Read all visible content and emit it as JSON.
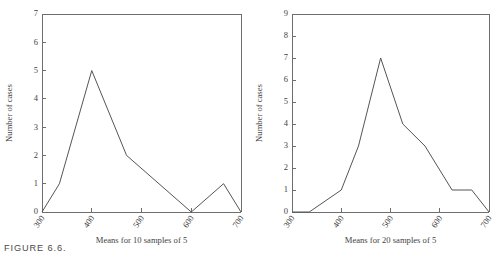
{
  "figure": {
    "caption": "FIGURE 6.6.",
    "ylabel": "Number of cases"
  },
  "chart_data": [
    {
      "type": "line",
      "title": "",
      "xlabel": "Means for 10 samples of 5",
      "ylabel": "Number of cases",
      "xlim": [
        300,
        700
      ],
      "ylim": [
        0,
        7
      ],
      "xticks": [
        300,
        400,
        500,
        600,
        700
      ],
      "xtick_labels": [
        "300",
        "400",
        "500",
        "600",
        "700"
      ],
      "yticks": [
        0,
        1,
        2,
        3,
        4,
        5,
        6,
        7
      ],
      "ytick_labels": [
        "0",
        "1",
        "2",
        "3",
        "4",
        "5",
        "6",
        "7"
      ],
      "grid": false,
      "legend": "none",
      "x": [
        300,
        335,
        400,
        470,
        600,
        665,
        700
      ],
      "values": [
        0,
        1,
        5,
        2,
        0,
        1,
        0
      ],
      "line_color": "#555555"
    },
    {
      "type": "line",
      "title": "",
      "xlabel": "Means for 20 samples of 5",
      "ylabel": "Number of cases",
      "xlim": [
        300,
        700
      ],
      "ylim": [
        0,
        9
      ],
      "xticks": [
        300,
        400,
        500,
        600,
        700
      ],
      "xtick_labels": [
        "300",
        "400",
        "500",
        "600",
        "700"
      ],
      "yticks": [
        0,
        1,
        2,
        3,
        4,
        5,
        6,
        7,
        8,
        9
      ],
      "ytick_labels": [
        "0",
        "1",
        "2",
        "3",
        "4",
        "5",
        "6",
        "7",
        "8",
        "9"
      ],
      "grid": false,
      "legend": "none",
      "x": [
        300,
        335,
        400,
        435,
        480,
        525,
        570,
        625,
        665,
        700
      ],
      "values": [
        0,
        0,
        1,
        3,
        7,
        4,
        3,
        1,
        1,
        0
      ],
      "line_color": "#555555"
    }
  ]
}
